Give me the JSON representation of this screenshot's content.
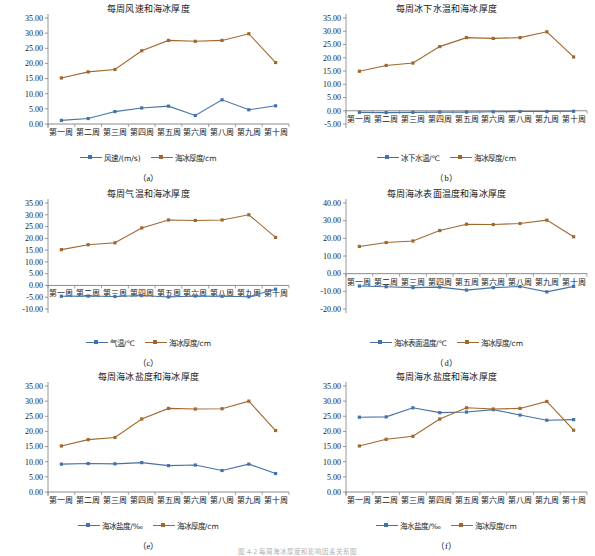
{
  "figure": {
    "caption": "图 4-2 每周海冰厚度和影响因素关系图",
    "weeks": [
      "第一周",
      "第二周",
      "第三周",
      "第四周",
      "第五周",
      "第六周",
      "第八周",
      "第九周",
      "第十周"
    ],
    "colors": {
      "blue": "#4472a8",
      "brown": "#a0682f",
      "axis": "#7f7f7f",
      "grid": "#d9d9d9",
      "text": "#202020"
    },
    "thickness_label": "海冰厚度/cm",
    "thickness_values": [
      15.2,
      17.2,
      18.0,
      24.2,
      27.6,
      27.3,
      27.6,
      29.8,
      20.3
    ]
  },
  "charts": [
    {
      "key": "a",
      "sub": "（a）",
      "chart_data": {
        "type": "line",
        "title": "每周风速和海冰厚度",
        "xlabel": "",
        "ylabel": "",
        "ylim": [
          0.0,
          35.0
        ],
        "yticks": [
          "0.00",
          "5.00",
          "10.00",
          "15.00",
          "20.00",
          "25.00",
          "30.00",
          "35.00"
        ],
        "grid": false,
        "legend": "bottom",
        "categories": [
          "第一周",
          "第二周",
          "第三周",
          "第四周",
          "第五周",
          "第六周",
          "第八周",
          "第九周",
          "第十周"
        ],
        "series": [
          {
            "name": "风速/(m/s)",
            "color": "#4472a8",
            "values": [
              1.2,
              1.8,
              4.1,
              5.3,
              5.9,
              2.8,
              8.0,
              4.7,
              6.0
            ]
          },
          {
            "name": "海冰厚度/cm",
            "color": "#a0682f",
            "values": [
              15.2,
              17.2,
              18.0,
              24.2,
              27.6,
              27.3,
              27.6,
              29.8,
              20.3
            ]
          }
        ]
      }
    },
    {
      "key": "b",
      "sub": "（b）",
      "chart_data": {
        "type": "line",
        "title": "每周冰下水温和海冰厚度",
        "xlabel": "",
        "ylabel": "",
        "ylim": [
          -5.0,
          35.0
        ],
        "yticks": [
          "-5.00",
          "0.00",
          "5.00",
          "10.00",
          "15.00",
          "20.00",
          "25.00",
          "30.00",
          "35.00"
        ],
        "grid": false,
        "legend": "bottom",
        "categories": [
          "第一周",
          "第二周",
          "第三周",
          "第四周",
          "第五周",
          "第六周",
          "第八周",
          "第九周",
          "第十周"
        ],
        "series": [
          {
            "name": "冰下水温/℃",
            "color": "#4472a8",
            "values": [
              -0.6,
              -0.7,
              -0.6,
              -0.5,
              -0.5,
              -0.4,
              -0.3,
              -0.3,
              -0.2
            ]
          },
          {
            "name": "海冰厚度/cm",
            "color": "#a0682f",
            "values": [
              14.9,
              17.1,
              18.0,
              24.2,
              27.6,
              27.3,
              27.6,
              29.8,
              20.3
            ]
          }
        ]
      }
    },
    {
      "key": "c",
      "sub": "（c）",
      "chart_data": {
        "type": "line",
        "title": "每周气温和海冰厚度",
        "xlabel": "",
        "ylabel": "",
        "ylim": [
          -10.0,
          35.0
        ],
        "yticks": [
          "-10.00",
          "-5.00",
          "0.00",
          "5.00",
          "10.00",
          "15.00",
          "20.00",
          "25.00",
          "30.00",
          "35.00"
        ],
        "grid": false,
        "legend": "bottom",
        "categories": [
          "第一周",
          "第二周",
          "第三周",
          "第四周",
          "第五周",
          "第六周",
          "第八周",
          "第九周",
          "第十周"
        ],
        "series": [
          {
            "name": "气温/℃",
            "color": "#4472a8",
            "values": [
              -4.6,
              -4.5,
              -4.7,
              -4.3,
              -4.9,
              -4.5,
              -4.6,
              -4.8,
              -1.6
            ]
          },
          {
            "name": "海冰厚度/cm",
            "color": "#a0682f",
            "values": [
              15.2,
              17.3,
              18.1,
              24.4,
              27.8,
              27.6,
              27.8,
              30.0,
              20.4
            ]
          }
        ]
      }
    },
    {
      "key": "d",
      "sub": "（d）",
      "chart_data": {
        "type": "line",
        "title": "每周海冰表面温度和海冰厚度",
        "xlabel": "",
        "ylabel": "",
        "ylim": [
          -20.0,
          40.0
        ],
        "yticks": [
          "-20.00",
          "-10.00",
          "0.00",
          "10.00",
          "20.00",
          "30.00",
          "40.00"
        ],
        "grid": false,
        "legend": "bottom",
        "categories": [
          "第一周",
          "第二周",
          "第三周",
          "第四周",
          "第五周",
          "第六周",
          "第八周",
          "第九周",
          "第十周"
        ],
        "series": [
          {
            "name": "海冰表面温度/℃",
            "color": "#4472a8",
            "values": [
              -7.0,
              -7.4,
              -7.9,
              -7.6,
              -9.3,
              -7.9,
              -7.3,
              -10.3,
              -7.2
            ]
          },
          {
            "name": "海冰厚度/cm",
            "color": "#a0682f",
            "values": [
              15.4,
              17.6,
              18.5,
              24.4,
              28.0,
              27.8,
              28.4,
              30.3,
              20.9
            ]
          }
        ]
      }
    },
    {
      "key": "e",
      "sub": "（e）",
      "chart_data": {
        "type": "line",
        "title": "每周海冰盐度和海冰厚度",
        "xlabel": "",
        "ylabel": "",
        "ylim": [
          0.0,
          35.0
        ],
        "yticks": [
          "0.00",
          "5.00",
          "10.00",
          "15.00",
          "20.00",
          "25.00",
          "30.00",
          "35.00"
        ],
        "grid": false,
        "legend": "bottom",
        "categories": [
          "第一周",
          "第二周",
          "第三周",
          "第四周",
          "第五周",
          "第六周",
          "第八周",
          "第九周",
          "第十周"
        ],
        "series": [
          {
            "name": "海冰盐度/‰",
            "color": "#4472a8",
            "values": [
              9.2,
              9.4,
              9.3,
              9.7,
              8.7,
              8.9,
              7.1,
              9.2,
              6.1
            ]
          },
          {
            "name": "海冰厚度/cm",
            "color": "#a0682f",
            "values": [
              15.2,
              17.3,
              18.0,
              24.1,
              27.6,
              27.4,
              27.5,
              30.0,
              20.3
            ]
          }
        ]
      }
    },
    {
      "key": "f",
      "sub": "（f）",
      "chart_data": {
        "type": "line",
        "title": "每周海水盐度和海冰厚度",
        "xlabel": "",
        "ylabel": "",
        "ylim": [
          0.0,
          35.0
        ],
        "yticks": [
          "0.00",
          "5.00",
          "10.00",
          "15.00",
          "20.00",
          "25.00",
          "30.00",
          "35.00"
        ],
        "grid": false,
        "legend": "bottom",
        "categories": [
          "第一周",
          "第二周",
          "第三周",
          "第四周",
          "第五周",
          "第六周",
          "第八周",
          "第九周",
          "第十周"
        ],
        "series": [
          {
            "name": "海水盐度/‰",
            "color": "#4472a8",
            "values": [
              24.7,
              24.8,
              27.8,
              26.2,
              26.4,
              27.2,
              25.4,
              23.7,
              23.9
            ]
          },
          {
            "name": "海冰厚度/cm",
            "color": "#a0682f",
            "values": [
              15.2,
              17.4,
              18.4,
              24.1,
              27.8,
              27.4,
              27.6,
              29.9,
              20.4
            ]
          }
        ]
      }
    }
  ]
}
